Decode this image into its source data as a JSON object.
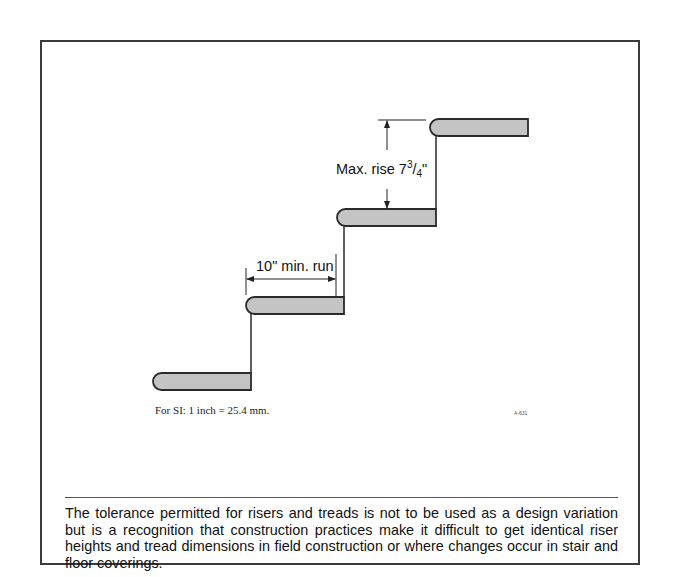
{
  "figure": {
    "labels": {
      "max_rise": "Max. rise 7",
      "max_rise_num": "3",
      "max_rise_slash": "/",
      "max_rise_den": "4",
      "max_rise_unit": "\"",
      "min_run": "10\" min. run"
    },
    "si_note": "For SI: 1 inch = 25.4 mm.",
    "figure_id": "A-631",
    "colors": {
      "tread_fill": "#c4c4c4",
      "stroke": "#2a2a2a",
      "frame": "#3a3a3a"
    },
    "treads": [
      {
        "x1": 153,
        "x2": 251,
        "y1": 373,
        "y2": 390
      },
      {
        "x1": 246,
        "x2": 344,
        "y1": 297,
        "y2": 314
      },
      {
        "x1": 337,
        "x2": 436,
        "y1": 209,
        "y2": 226
      },
      {
        "x1": 430,
        "x2": 528,
        "y1": 119,
        "y2": 136
      }
    ]
  },
  "caption": "The tolerance permitted for risers and treads is not to be used as a design variation but is a recognition that construction practices make it difficult to get identical riser heights and tread dimensions in field construction or where changes occur in stair and floor coverings."
}
